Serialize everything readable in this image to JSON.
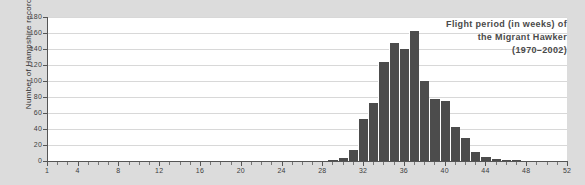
{
  "chart_data": {
    "type": "bar",
    "title": "Flight period (in weeks) of the Migrant Hawker (1970–2002)",
    "title_lines": [
      "Flight period (in weeks) of",
      "the Migrant Hawker",
      "(1970–2002)"
    ],
    "xlabel": "",
    "ylabel": "Number of Hampshire records",
    "xlim": [
      1,
      52
    ],
    "ylim": [
      0,
      180
    ],
    "ytick_step": 20,
    "yticks": [
      0,
      20,
      40,
      60,
      80,
      100,
      120,
      140,
      160,
      180
    ],
    "ytick_labels": [
      "0",
      "20",
      "40",
      "60",
      "80",
      "100",
      "120",
      "140",
      "160",
      "180"
    ],
    "xticks_minor_step": 1,
    "xticks_labeled": [
      1,
      4,
      8,
      12,
      16,
      20,
      24,
      28,
      32,
      36,
      40,
      44,
      48,
      52
    ],
    "xtick_labels": [
      "1",
      "4",
      "8",
      "12",
      "16",
      "20",
      "24",
      "28",
      "32",
      "36",
      "40",
      "44",
      "48",
      "52"
    ],
    "grid": "horizontal",
    "legend": "none",
    "bar_color": "#4c4c4c",
    "plot_background": "#ffffff",
    "figure_background": "#dcdcdc",
    "categories": [
      1,
      2,
      3,
      4,
      5,
      6,
      7,
      8,
      9,
      10,
      11,
      12,
      13,
      14,
      15,
      16,
      17,
      18,
      19,
      20,
      21,
      22,
      23,
      24,
      25,
      26,
      27,
      28,
      29,
      30,
      31,
      32,
      33,
      34,
      35,
      36,
      37,
      38,
      39,
      40,
      41,
      42,
      43,
      44,
      45,
      46,
      47,
      48,
      49,
      50,
      51,
      52
    ],
    "values": [
      0,
      0,
      0,
      0,
      0,
      0,
      0,
      0,
      0,
      0,
      0,
      0,
      0,
      0,
      0,
      0,
      0,
      0,
      0,
      0,
      0,
      0,
      0,
      0,
      0,
      0,
      0,
      0,
      1,
      4,
      14,
      52,
      73,
      124,
      148,
      140,
      163,
      100,
      78,
      75,
      43,
      29,
      11,
      5,
      2,
      1,
      1,
      0,
      0,
      0,
      0,
      0
    ]
  },
  "colors": {
    "accent": "#4c4c4c",
    "grid": "#d8d8d8",
    "axis": "#555555",
    "text": "#3c3c3c",
    "title_text": "#4a4a4a",
    "background": "#dcdcdc"
  }
}
